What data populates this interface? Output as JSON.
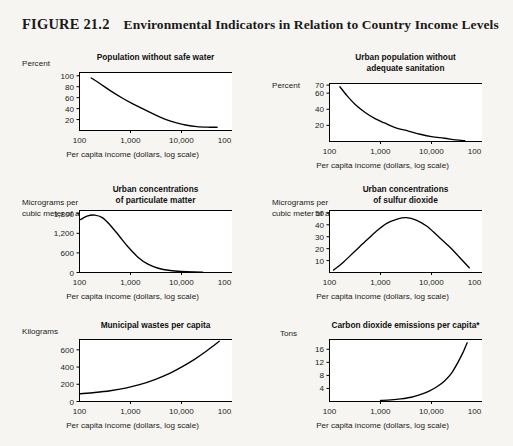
{
  "figure": {
    "number": "FIGURE 21.2",
    "title": "Environmental Indicators in Relation to Country Income Levels"
  },
  "common": {
    "xlabel": "Per capita income (dollars, log scale)",
    "xticks": [
      "100",
      "1,000",
      "10,000",
      "100,000"
    ],
    "line_color": "#000000",
    "plot_bg": "#ffffff",
    "page_bg": "#f6f5f1"
  },
  "chart_data": [
    {
      "id": "population-without-safe-water",
      "type": "line",
      "title": "Population without safe water",
      "ylabel": "Percent",
      "xlabel": "Per capita income (dollars, log scale)",
      "xscale": "log",
      "xlim": [
        100,
        100000
      ],
      "xticks": [
        100,
        1000,
        10000,
        100000
      ],
      "xticklabels": [
        "100",
        "1,000",
        "10,000",
        "100,000"
      ],
      "ylim": [
        0,
        106
      ],
      "yticks": [
        20,
        40,
        60,
        80,
        100
      ],
      "yticklabels": [
        "20",
        "40",
        "60",
        "80",
        "100"
      ],
      "grid": false,
      "legend": "none",
      "x": [
        170,
        250,
        400,
        700,
        1000,
        1800,
        3000,
        5000,
        8000,
        12000,
        20000,
        35000,
        50000
      ],
      "values": [
        96,
        86,
        73,
        59,
        51,
        39,
        29,
        20,
        14,
        10,
        7,
        6,
        6
      ]
    },
    {
      "id": "urban-population-without-adequate-sanitation",
      "type": "line",
      "title": "Urban population without\nadequate sanitation",
      "ylabel": "Percent",
      "xlabel": "Per capita income (dollars, log scale)",
      "xscale": "log",
      "xlim": [
        100,
        100000
      ],
      "xticks": [
        100,
        1000,
        10000,
        100000
      ],
      "xticklabels": [
        "100",
        "1,000",
        "10,000",
        "100,000"
      ],
      "ylim": [
        0,
        72
      ],
      "yticks": [
        20,
        40,
        60,
        70
      ],
      "yticklabels": [
        "20",
        "40",
        "60",
        "70"
      ],
      "grid": false,
      "legend": "none",
      "x": [
        160,
        220,
        320,
        500,
        800,
        1200,
        2000,
        3500,
        6000,
        10000,
        18000,
        30000,
        45000
      ],
      "values": [
        68,
        57,
        46,
        36,
        28,
        23,
        17,
        13,
        9,
        6,
        4,
        2,
        1
      ]
    },
    {
      "id": "urban-concentrations-of-particulate-matter",
      "type": "line",
      "title": "Urban concentrations\nof particulate matter",
      "ylabel": "Micrograms per\ncubic meter of air",
      "xlabel": "Per capita income (dollars, log scale)",
      "xscale": "log",
      "xlim": [
        100,
        100000
      ],
      "xticks": [
        100,
        1000,
        10000,
        100000
      ],
      "xticklabels": [
        "100",
        "1,000",
        "10,000",
        "100,000"
      ],
      "ylim": [
        0,
        1900
      ],
      "yticks": [
        0,
        600,
        1200,
        1800
      ],
      "yticklabels": [
        "0",
        "600",
        "1,200",
        "1,800"
      ],
      "grid": false,
      "legend": "none",
      "x": [
        105,
        140,
        200,
        280,
        400,
        600,
        900,
        1400,
        2200,
        3500,
        6000,
        10000,
        18000,
        26000
      ],
      "values": [
        1620,
        1730,
        1760,
        1680,
        1450,
        1120,
        780,
        470,
        255,
        130,
        60,
        30,
        15,
        12
      ]
    },
    {
      "id": "urban-concentrations-of-sulfur-dioxide",
      "type": "line",
      "title": "Urban concentrations\nof sulfur dioxide",
      "ylabel": "Micrograms per\ncubic meter of air",
      "xlabel": "Per capita income (dollars, log scale)",
      "xscale": "log",
      "xlim": [
        100,
        100000
      ],
      "xticks": [
        100,
        1000,
        10000,
        100000
      ],
      "xticklabels": [
        "100",
        "1,000",
        "10,000",
        "100,000"
      ],
      "ylim": [
        0,
        52
      ],
      "yticks": [
        10,
        20,
        30,
        40,
        50
      ],
      "yticklabels": [
        "10",
        "20",
        "30",
        "40",
        "50"
      ],
      "grid": false,
      "legend": "none",
      "x": [
        120,
        180,
        300,
        500,
        800,
        1300,
        2200,
        3200,
        5000,
        8000,
        13000,
        22000,
        35000,
        55000
      ],
      "values": [
        2,
        8,
        17,
        26,
        34,
        41,
        45,
        46,
        44,
        39,
        31,
        22,
        13,
        4
      ]
    },
    {
      "id": "municipal-wastes-per-capita",
      "type": "line",
      "title": "Municipal wastes per capita",
      "ylabel": "Kilograms",
      "xlabel": "Per capita income (dollars, log scale)",
      "xscale": "log",
      "xlim": [
        100,
        100000
      ],
      "xticks": [
        100,
        1000,
        10000,
        100000
      ],
      "xticklabels": [
        "100",
        "1,000",
        "10,000",
        "100,000"
      ],
      "ylim": [
        0,
        720
      ],
      "yticks": [
        0,
        200,
        400,
        600
      ],
      "yticklabels": [
        "0",
        "200",
        "400",
        "600"
      ],
      "grid": false,
      "legend": "none",
      "x": [
        100,
        200,
        400,
        800,
        1500,
        3000,
        6000,
        10000,
        18000,
        30000,
        45000,
        55000
      ],
      "values": [
        90,
        105,
        125,
        155,
        195,
        255,
        330,
        400,
        490,
        580,
        660,
        700
      ]
    },
    {
      "id": "carbon-dioxide-emissions-per-capita",
      "type": "line",
      "title": "Carbon dioxide emissions per capita*",
      "ylabel": "Tons",
      "xlabel": "Per capita income (dollars, log scale)",
      "xscale": "log",
      "xlim": [
        100,
        100000
      ],
      "xticks": [
        100,
        1000,
        10000,
        100000
      ],
      "xticklabels": [
        "100",
        "1,000",
        "10,000",
        "100,000"
      ],
      "ylim": [
        0,
        19
      ],
      "yticks": [
        4,
        8,
        12,
        16
      ],
      "yticklabels": [
        "4",
        "8",
        "12",
        "16"
      ],
      "grid": false,
      "legend": "none",
      "x": [
        1000,
        1600,
        2500,
        4000,
        6000,
        9000,
        13000,
        18000,
        25000,
        33000,
        42000,
        50000
      ],
      "values": [
        0.3,
        0.5,
        0.8,
        1.3,
        2.1,
        3.2,
        4.6,
        6.3,
        8.8,
        12.0,
        15.2,
        18.0
      ]
    }
  ]
}
